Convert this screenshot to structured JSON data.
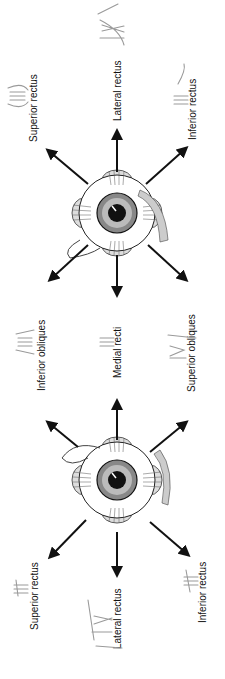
{
  "diagram": {
    "top_eye": {
      "labels": {
        "superior": "Superior rectus",
        "lateral": "Lateral rectus",
        "inferior": "Inferior rectus"
      },
      "nerves": {
        "superior": "III",
        "lateral": "VI",
        "inferior": "III"
      }
    },
    "middle": {
      "labels": {
        "inferior_obliques": "Inferior obliques",
        "medial_recti": "Medial recti",
        "superior_obliques": "Superior obliques"
      },
      "nerves": {
        "inferior_obliques": "III",
        "medial_recti": "III",
        "superior_obliques": "IV"
      }
    },
    "bottom_eye": {
      "labels": {
        "superior": "Superior rectus",
        "lateral": "Lateral rectus",
        "inferior": "Inferior rectus"
      },
      "nerves": {
        "superior": "III",
        "lateral": "VI",
        "inferior": "III"
      }
    },
    "colors": {
      "ink": "#111111",
      "handwriting": "#9a9a9a",
      "background": "#ffffff"
    }
  }
}
